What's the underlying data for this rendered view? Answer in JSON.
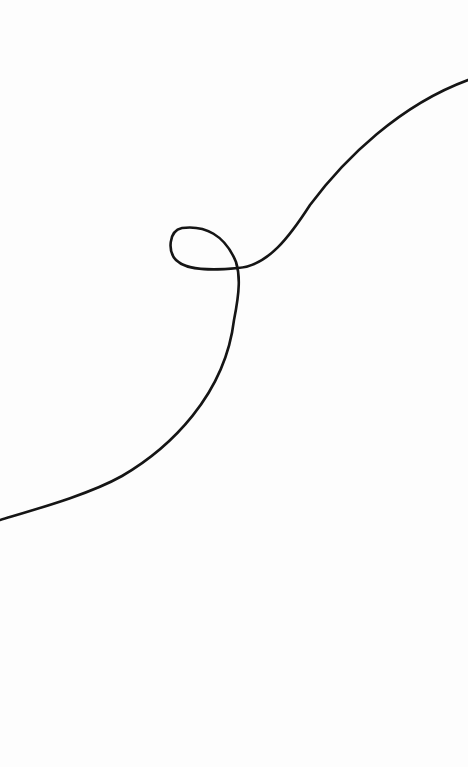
{
  "drawing": {
    "background": "#fdfdfd",
    "stroke_color": "#151515",
    "stroke_width": 2.6,
    "curve_path": "M 0 520 C 40 508, 90 494, 122 476 C 170 448, 225 395, 234 320 C 240 290, 240 275, 236 262 C 225 235, 205 225, 182 228 C 168 231, 168 252, 176 260 C 188 272, 218 270, 238 268 C 268 266, 290 236, 310 205 C 345 158, 400 105, 468 80"
  }
}
